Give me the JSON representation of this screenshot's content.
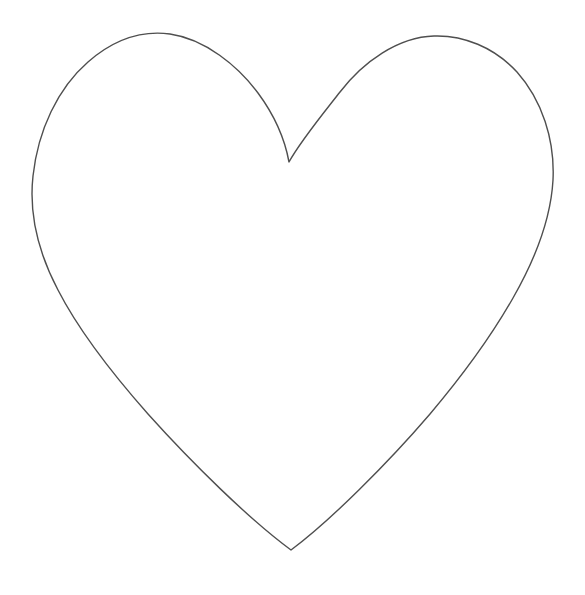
{
  "canvas": {
    "width": 585,
    "height": 595,
    "background_color": "#ffffff",
    "title": "Heart Outline"
  },
  "drawing": {
    "name": "heart-outline",
    "description": "Hand-drawn single-stroke outline of a symmetrical heart shape on a blank white page",
    "stroke_color": "#4f4f4f",
    "stroke_width": 1.4,
    "fill": "none",
    "line_join": "round",
    "line_cap": "round"
  },
  "shape_data": {
    "type": "path",
    "key_points": {
      "top_cleft": [
        289,
        162
      ],
      "left_lobe_apex": [
        155,
        34
      ],
      "right_lobe_apex": [
        445,
        42
      ],
      "leftmost": [
        32,
        202
      ],
      "rightmost": [
        554,
        207
      ],
      "bottom_tip": [
        291,
        550
      ],
      "left_side_inflection": [
        118,
        332
      ],
      "right_side_inflection": [
        466,
        372
      ]
    },
    "bounding_box": {
      "x": 32,
      "y": 33,
      "width": 522,
      "height": 518
    },
    "path_d": "M 289 162 C 285 140 275 116 258 93 C 238 66 205 39 170 34 C 140 30 112 41 88 62 C 58 88 38 130 33 176 C 29 212 38 252 58 290 C 78 329 110 371 148 414 C 192 463 250 520 291 550 C 330 521 388 463 430 414 C 463 375 492 335 513 298 C 537 256 551 216 553 180 C 555 140 542 100 517 72 C 494 47 463 35 434 36 C 398 37 363 62 340 92 C 318 120 300 142 289 162 Z"
  },
  "elements": {
    "heart_label": "heart-outline",
    "page_label": "blank-page"
  }
}
